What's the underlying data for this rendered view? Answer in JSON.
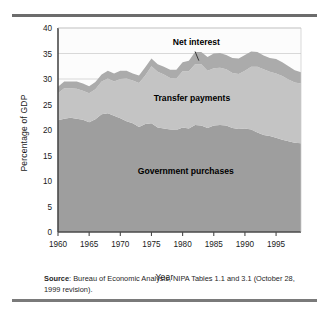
{
  "figure": {
    "ylabel": "Percentage of GDP",
    "xlabel": "Year",
    "source_prefix": "Source",
    "source_text": ": Bureau of Economic Analysis, NIPA Tables 1.1 and 3.1 (October 28, 1999 revision).",
    "colors": {
      "government_purchases": "#9e9e9e",
      "transfer_payments": "#c4c4c4",
      "net_interest": "#ababab",
      "plot_background": "#fcfcfc",
      "axis": "#4a4a4a",
      "gridline": "#c9c9c9",
      "rule": "#6c6c6c"
    }
  },
  "chart_data": {
    "type": "area",
    "title": "",
    "subtitle": "",
    "xlabel": "Year",
    "ylabel": "Percentage of GDP",
    "xlim": [
      1960,
      1999
    ],
    "ylim": [
      0,
      40
    ],
    "ytick_labels": [
      "0",
      "5",
      "10",
      "15",
      "20",
      "25",
      "30",
      "35",
      "40"
    ],
    "yticks": [
      0,
      5,
      10,
      15,
      20,
      25,
      30,
      35,
      40
    ],
    "xtick_labels": [
      "1960",
      "1965",
      "1970",
      "1975",
      "1980",
      "1985",
      "1990",
      "1995"
    ],
    "xticks": [
      1960,
      1965,
      1970,
      1975,
      1980,
      1985,
      1990,
      1995
    ],
    "grid": "horizontal-major",
    "legend_position": "inline-annotations",
    "stacked": true,
    "annotations": [
      {
        "text": "Net interest",
        "band": "net_interest",
        "leader": true
      },
      {
        "text": "Transfer payments",
        "band": "transfer_payments",
        "leader": false
      },
      {
        "text": "Government purchases",
        "band": "government_purchases",
        "leader": false
      }
    ],
    "x": [
      1960,
      1961,
      1962,
      1963,
      1964,
      1965,
      1966,
      1967,
      1968,
      1969,
      1970,
      1971,
      1972,
      1973,
      1974,
      1975,
      1976,
      1977,
      1978,
      1979,
      1980,
      1981,
      1982,
      1983,
      1984,
      1985,
      1986,
      1987,
      1988,
      1989,
      1990,
      1991,
      1992,
      1993,
      1994,
      1995,
      1996,
      1997,
      1998,
      1999
    ],
    "series": [
      {
        "name": "Government purchases",
        "values": [
          21.9,
          22.2,
          22.4,
          22.2,
          22.0,
          21.5,
          22.1,
          23.1,
          23.3,
          22.8,
          22.3,
          21.7,
          21.3,
          20.6,
          21.2,
          21.3,
          20.5,
          20.3,
          20.1,
          20.0,
          20.5,
          20.3,
          21.0,
          20.9,
          20.4,
          20.9,
          21.0,
          20.9,
          20.4,
          20.2,
          20.3,
          20.1,
          19.5,
          19.0,
          18.8,
          18.5,
          18.1,
          17.8,
          17.5,
          17.4
        ]
      },
      {
        "name": "Transfer payments",
        "values": [
          5.3,
          6.0,
          5.8,
          5.9,
          5.7,
          5.7,
          5.9,
          6.4,
          6.8,
          6.7,
          7.7,
          8.4,
          8.4,
          8.6,
          9.5,
          11.2,
          10.9,
          10.6,
          10.1,
          10.1,
          11.0,
          11.2,
          11.9,
          12.0,
          11.2,
          11.2,
          11.2,
          11.0,
          10.8,
          10.8,
          11.3,
          12.3,
          12.9,
          12.9,
          12.6,
          12.6,
          12.5,
          12.1,
          11.8,
          11.7
        ]
      },
      {
        "name": "Net interest",
        "values": [
          1.3,
          1.3,
          1.3,
          1.4,
          1.4,
          1.4,
          1.4,
          1.4,
          1.5,
          1.6,
          1.6,
          1.5,
          1.4,
          1.5,
          1.6,
          1.5,
          1.5,
          1.5,
          1.6,
          1.7,
          1.8,
          2.1,
          2.4,
          2.4,
          2.7,
          2.9,
          2.9,
          2.8,
          2.9,
          3.0,
          3.1,
          3.0,
          2.9,
          2.7,
          2.7,
          2.8,
          2.7,
          2.6,
          2.4,
          2.2
        ]
      }
    ]
  }
}
